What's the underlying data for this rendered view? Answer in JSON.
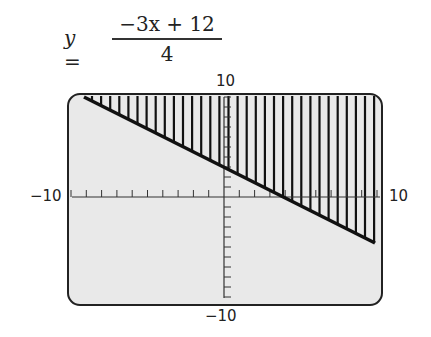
{
  "equation": {
    "lhs": "y =",
    "numerator": "−3x + 12",
    "denominator": "4"
  },
  "labels": {
    "ymax": "10",
    "ymin": "−10",
    "xmin": "−10",
    "xmax": "10"
  },
  "chart_data": {
    "type": "line",
    "series": [
      {
        "name": "boundary",
        "x": [
          -10,
          10
        ],
        "y": [
          10.5,
          -4.5
        ]
      }
    ],
    "shading": "above line (vertical hatching)",
    "xlim": [
      -10,
      10
    ],
    "ylim": [
      -10,
      10
    ],
    "xticks_step": 1,
    "yticks_step": 1,
    "grid": false
  }
}
